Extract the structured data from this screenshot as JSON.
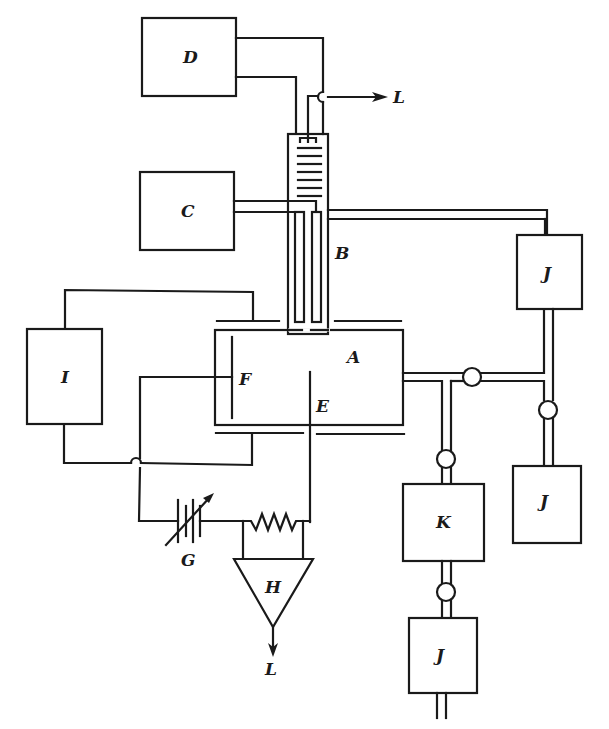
{
  "diagram": {
    "type": "schematic",
    "labels": {
      "A": "A",
      "B": "B",
      "C": "C",
      "D": "D",
      "E": "E",
      "F": "F",
      "G": "G",
      "H": "H",
      "I": "I",
      "J": "J",
      "K": "K",
      "L": "L"
    },
    "blocks": [
      {
        "id": "D",
        "label": "D"
      },
      {
        "id": "C",
        "label": "C"
      },
      {
        "id": "I",
        "label": "I"
      },
      {
        "id": "A",
        "label": "A"
      },
      {
        "id": "K",
        "label": "K"
      },
      {
        "id": "J1",
        "label": "J"
      },
      {
        "id": "J2",
        "label": "J"
      },
      {
        "id": "J3",
        "label": "J"
      },
      {
        "id": "H",
        "label": "H"
      }
    ],
    "outputs": [
      {
        "id": "L-top",
        "label": "L"
      },
      {
        "id": "L-bottom",
        "label": "L"
      }
    ]
  }
}
